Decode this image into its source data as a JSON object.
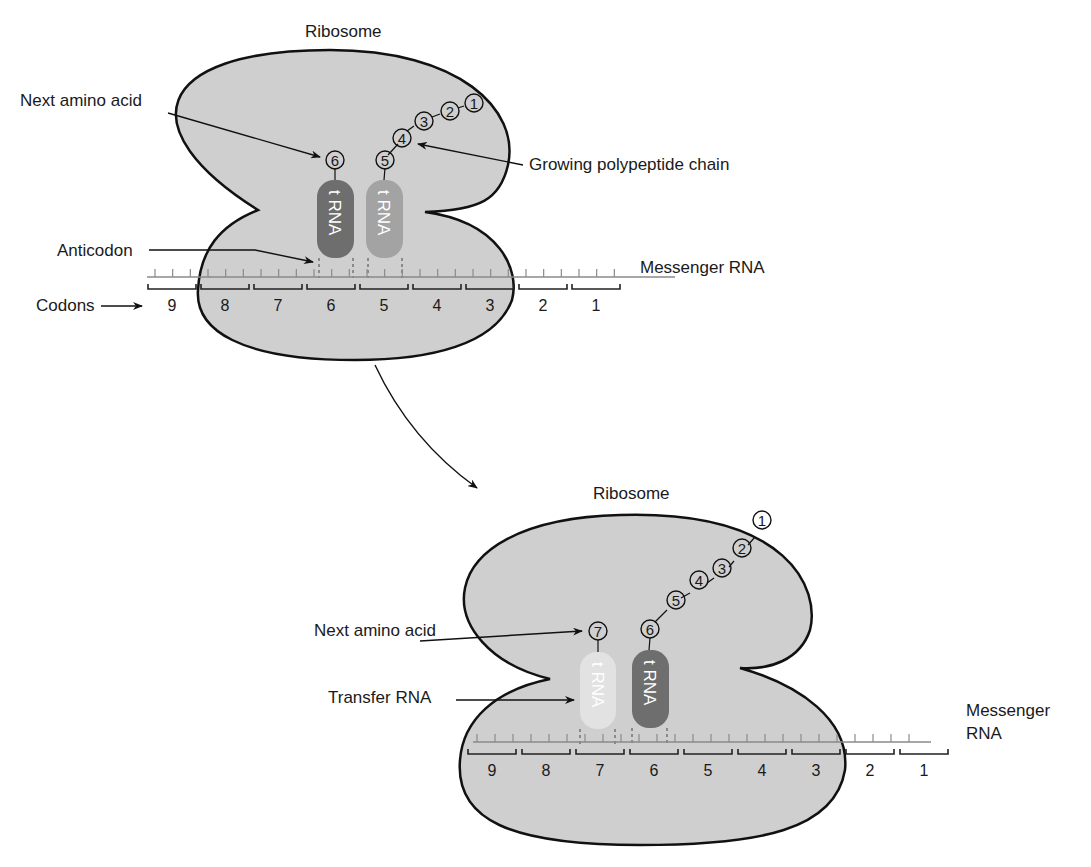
{
  "panel_top": {
    "title": "Ribosome",
    "labels": {
      "next_amino_acid": "Next amino acid",
      "growing_chain": "Growing polypeptide chain",
      "anticodon": "Anticodon",
      "messenger_rna": "Messenger RNA",
      "codons": "Codons"
    },
    "codon_numbers": [
      "9",
      "8",
      "7",
      "6",
      "5",
      "4",
      "3",
      "2",
      "1"
    ],
    "amino_acids": [
      "1",
      "2",
      "3",
      "4",
      "5",
      "6"
    ],
    "trna_left": {
      "label": "t RNA",
      "color": "#6e6e6e"
    },
    "trna_right": {
      "label": "t RNA",
      "color": "#a3a3a3"
    }
  },
  "panel_bottom": {
    "title": "Ribosome",
    "labels": {
      "next_amino_acid": "Next amino acid",
      "transfer_rna": "Transfer RNA",
      "messenger_rna_line1": "Messenger",
      "messenger_rna_line2": "RNA"
    },
    "codon_numbers": [
      "9",
      "8",
      "7",
      "6",
      "5",
      "4",
      "3",
      "2",
      "1"
    ],
    "amino_acids": [
      "1",
      "2",
      "3",
      "4",
      "5",
      "6",
      "7"
    ],
    "trna_left": {
      "label": "t RNA",
      "color": "#e2e2e2"
    },
    "trna_right": {
      "label": "t RNA",
      "color": "#6e6e6e"
    }
  },
  "colors": {
    "ribosome_fill": "#cfcfcf",
    "outline": "#111111",
    "mrna_line": "#8a8a8a"
  }
}
